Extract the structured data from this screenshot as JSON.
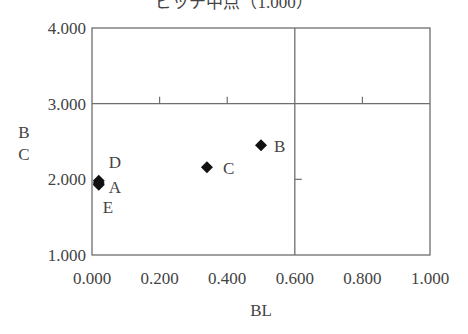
{
  "chart_data": {
    "type": "scatter",
    "title": "ピッチ中点（1.000）",
    "xlabel": "BL",
    "ylabel": "BC",
    "xlim": [
      0.0,
      1.0
    ],
    "ylim": [
      1.0,
      4.0
    ],
    "x_ticks": [
      "0.000",
      "0.200",
      "0.400",
      "0.600",
      "0.800",
      "1.000"
    ],
    "y_ticks": [
      "1.000",
      "2.000",
      "3.000",
      "4.000"
    ],
    "reference_lines": {
      "x": 0.6,
      "y": 3.0
    },
    "grid": false,
    "legend": null,
    "points": [
      {
        "label": "A",
        "x": 0.02,
        "y": 1.95
      },
      {
        "label": "B",
        "x": 0.5,
        "y": 2.45
      },
      {
        "label": "C",
        "x": 0.34,
        "y": 2.16
      },
      {
        "label": "D",
        "x": 0.02,
        "y": 1.98
      },
      {
        "label": "E",
        "x": 0.02,
        "y": 1.93
      }
    ]
  },
  "colors": {
    "frame": "#6e6e6e",
    "marker": "#111111",
    "text": "#444444"
  }
}
